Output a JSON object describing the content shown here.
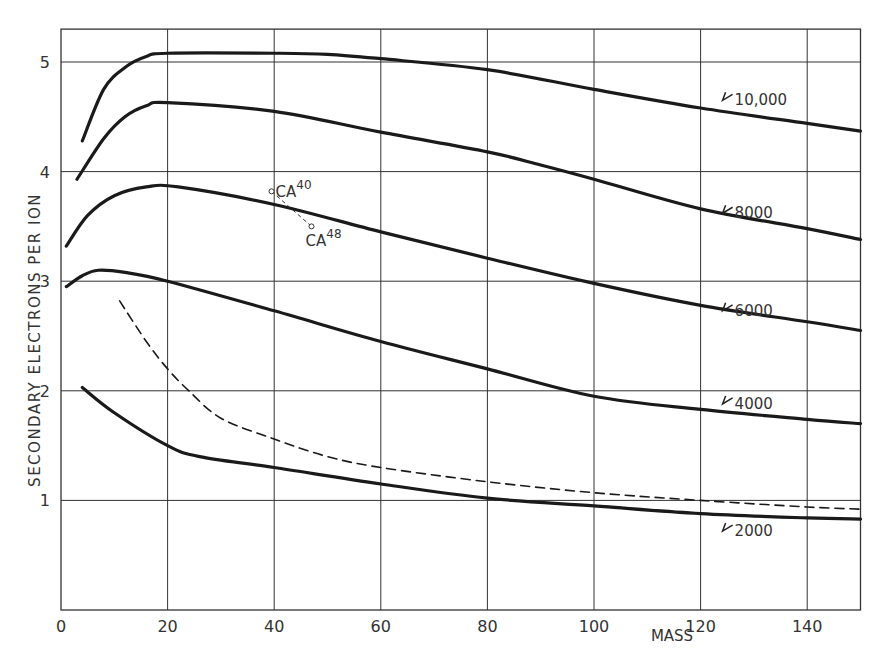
{
  "chart_data": {
    "type": "line",
    "title": "",
    "xlabel": "MASS",
    "ylabel": "SECONDARY ELECTRONS PER ION",
    "xlim": [
      0,
      150
    ],
    "ylim": [
      0,
      5.3
    ],
    "grid": true,
    "x_ticks": [
      0,
      20,
      40,
      60,
      80,
      100,
      120,
      140
    ],
    "x_tick_labels": [
      "0",
      "20",
      "40",
      "60",
      "80",
      "100",
      "120",
      "140"
    ],
    "y_ticks": [
      1,
      2,
      3,
      4,
      5
    ],
    "y_tick_labels": [
      "1",
      "2",
      "3",
      "4",
      "5"
    ],
    "series": [
      {
        "name": "10,000",
        "style": "solid",
        "x": [
          4,
          8,
          12,
          16,
          20,
          40,
          50,
          60,
          80,
          100,
          120,
          140,
          150
        ],
        "y": [
          4.28,
          4.75,
          4.95,
          5.05,
          5.08,
          5.08,
          5.07,
          5.03,
          4.93,
          4.75,
          4.58,
          4.44,
          4.37
        ],
        "label_x": 120,
        "label_y": 4.65
      },
      {
        "name": "8000",
        "style": "solid",
        "x": [
          3,
          8,
          12,
          16,
          20,
          40,
          60,
          80,
          90,
          100,
          120,
          140,
          150
        ],
        "y": [
          3.93,
          4.3,
          4.5,
          4.6,
          4.63,
          4.55,
          4.36,
          4.18,
          4.06,
          3.93,
          3.66,
          3.48,
          3.38
        ],
        "label_x": 120,
        "label_y": 3.62
      },
      {
        "name": "6000",
        "style": "solid",
        "x": [
          1,
          5,
          10,
          16,
          22,
          40,
          60,
          80,
          100,
          120,
          140,
          150
        ],
        "y": [
          3.32,
          3.6,
          3.78,
          3.86,
          3.86,
          3.7,
          3.45,
          3.21,
          2.98,
          2.78,
          2.63,
          2.55
        ],
        "label_x": 120,
        "label_y": 2.73
      },
      {
        "name": "4000",
        "style": "solid",
        "x": [
          1,
          4,
          7,
          12,
          20,
          40,
          60,
          80,
          100,
          120,
          140,
          150
        ],
        "y": [
          2.95,
          3.05,
          3.1,
          3.08,
          3.0,
          2.73,
          2.45,
          2.2,
          1.95,
          1.83,
          1.74,
          1.7
        ],
        "label_x": 120,
        "label_y": 1.88
      },
      {
        "name": "2000",
        "style": "solid",
        "x": [
          4,
          10,
          20,
          26,
          40,
          60,
          80,
          100,
          120,
          140,
          150
        ],
        "y": [
          2.03,
          1.8,
          1.5,
          1.4,
          1.3,
          1.15,
          1.02,
          0.95,
          0.88,
          0.84,
          0.83
        ],
        "label_x": 120,
        "label_y": 0.72
      },
      {
        "name": "dashed",
        "style": "dashed",
        "x": [
          11,
          16,
          20,
          24,
          30,
          40,
          50,
          60,
          80,
          100,
          120,
          140,
          150
        ],
        "y": [
          2.82,
          2.45,
          2.2,
          2.0,
          1.75,
          1.56,
          1.4,
          1.3,
          1.17,
          1.07,
          1.0,
          0.94,
          0.92
        ]
      }
    ],
    "annotations": [
      {
        "text": "CA",
        "sup": "40",
        "x": 39.5,
        "y": 3.82
      },
      {
        "text": "CA",
        "sup": "48",
        "x": 47,
        "y": 3.5
      }
    ]
  }
}
